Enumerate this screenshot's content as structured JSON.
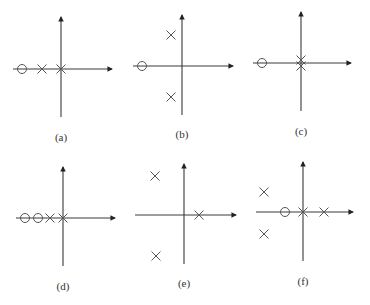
{
  "figure": {
    "marker_legend": {
      "pole": "×",
      "zero": "○"
    },
    "colors": {
      "axis": "#3a3a3a",
      "marker": "#555555",
      "label": "#333333"
    }
  },
  "plots": [
    {
      "id": "a",
      "label": "(a)",
      "origin": [
        61,
        69
      ],
      "v_axis": [
        17,
        117
      ],
      "h_axis": [
        13,
        112
      ],
      "label_pos": [
        61,
        141
      ],
      "poles": [
        [
          42,
          69
        ],
        [
          61,
          69
        ]
      ],
      "zeros": [
        [
          22,
          69
        ]
      ]
    },
    {
      "id": "b",
      "label": "(b)",
      "origin": [
        182,
        66
      ],
      "v_axis": [
        15,
        115
      ],
      "h_axis": [
        133,
        233
      ],
      "label_pos": [
        182,
        138
      ],
      "poles": [
        [
          171,
          35
        ],
        [
          171,
          97
        ]
      ],
      "zeros": [
        [
          142,
          66
        ]
      ]
    },
    {
      "id": "c",
      "label": "(c)",
      "origin": [
        301,
        63
      ],
      "v_axis": [
        12,
        111
      ],
      "h_axis": [
        253,
        351
      ],
      "label_pos": [
        301,
        135
      ],
      "poles": [
        [
          301,
          60
        ],
        [
          301,
          66
        ]
      ],
      "zeros": [
        [
          262,
          63
        ]
      ]
    },
    {
      "id": "d",
      "label": "(d)",
      "origin": [
        63,
        218
      ],
      "v_axis": [
        167,
        266
      ],
      "h_axis": [
        16,
        115
      ],
      "label_pos": [
        63,
        290
      ],
      "poles": [
        [
          50,
          218
        ],
        [
          63,
          218
        ]
      ],
      "zeros": [
        [
          25,
          218
        ],
        [
          38,
          218
        ]
      ]
    },
    {
      "id": "e",
      "label": "(e)",
      "origin": [
        184,
        215
      ],
      "v_axis": [
        164,
        264
      ],
      "h_axis": [
        135,
        236
      ],
      "label_pos": [
        184,
        287
      ],
      "poles": [
        [
          155,
          176
        ],
        [
          199,
          215
        ],
        [
          156,
          256
        ]
      ],
      "zeros": []
    },
    {
      "id": "f",
      "label": "(f)",
      "origin": [
        303,
        212
      ],
      "v_axis": [
        162,
        261
      ],
      "h_axis": [
        256,
        353
      ],
      "label_pos": [
        303,
        285
      ],
      "poles": [
        [
          264,
          192
        ],
        [
          264,
          234
        ],
        [
          303,
          212
        ],
        [
          324,
          212
        ]
      ],
      "zeros": [
        [
          285,
          212
        ]
      ]
    }
  ]
}
